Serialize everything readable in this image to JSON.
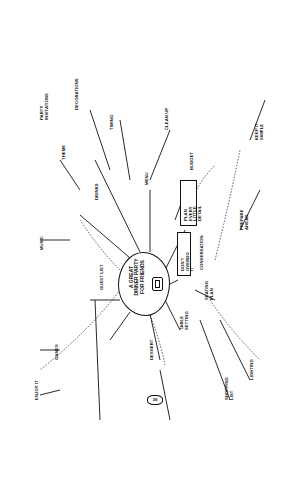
{
  "mindmap": {
    "center": {
      "label": "A GREAT\nDINNER PARTY\nFOR FRIENDS",
      "icon": "cooking-pot-icon"
    },
    "boxed_nodes": [
      {
        "label": "PLAN EVERY\nLITTLE DETAIL"
      },
      {
        "label": "DON'T OVERDO IT"
      }
    ],
    "page_number": "39",
    "nodes": [
      {
        "label": "PARTY\nINVITATIONS"
      },
      {
        "label": "THEME"
      },
      {
        "label": "DECORATIONS"
      },
      {
        "label": "GUEST LIST"
      },
      {
        "label": "MUSIC"
      },
      {
        "label": "DRINKS"
      },
      {
        "label": "MENU"
      },
      {
        "label": "DESSERT"
      },
      {
        "label": "TABLE\nSETTING"
      },
      {
        "label": "SEATING\nPLAN"
      },
      {
        "label": "SHOPPING\nLIST"
      },
      {
        "label": "LIGHTING"
      },
      {
        "label": "CONVERSATION"
      },
      {
        "label": "GAMES"
      },
      {
        "label": "TIMING"
      },
      {
        "label": "CLEAN UP"
      },
      {
        "label": "BUDGET"
      },
      {
        "label": "PREPARE\nAHEAD"
      },
      {
        "label": "KEEP IT\nSIMPLE"
      },
      {
        "label": "ENJOY IT"
      }
    ]
  }
}
